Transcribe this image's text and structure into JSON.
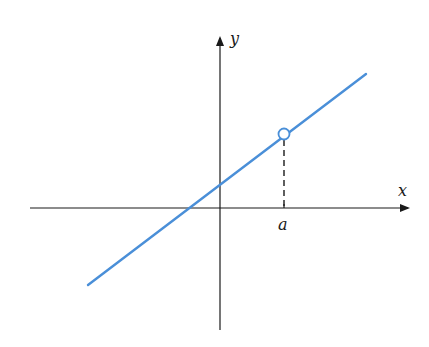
{
  "diagram": {
    "x_axis_label": "x",
    "y_axis_label": "y",
    "point_label": "a",
    "line_color": "#4a8fd8",
    "axis_color": "#1a1a1a",
    "elements": {
      "line": "straight line with positive slope",
      "hole": "open circle on the line above x = a",
      "dashed_guide": "vertical dashed line from hole down to x-axis at a"
    }
  }
}
